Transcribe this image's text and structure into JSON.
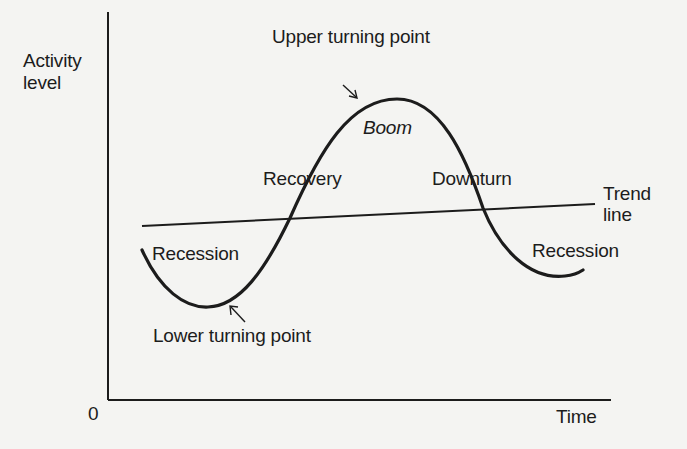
{
  "figure": {
    "axes": {
      "y_label_line1": "Activity",
      "y_label_line2": "level",
      "x_label": "Time",
      "origin_label": "0"
    },
    "labels": {
      "upper_turning_point": "Upper turning point",
      "boom": "Boom",
      "recovery": "Recovery",
      "downturn": "Downturn",
      "trend_line_1": "Trend",
      "trend_line_2": "line",
      "recession_left": "Recession",
      "recession_right": "Recession",
      "lower_turning_point": "Lower turning point"
    },
    "colors": {
      "background": "#f4f4f2",
      "ink": "#1c1c1c"
    }
  }
}
